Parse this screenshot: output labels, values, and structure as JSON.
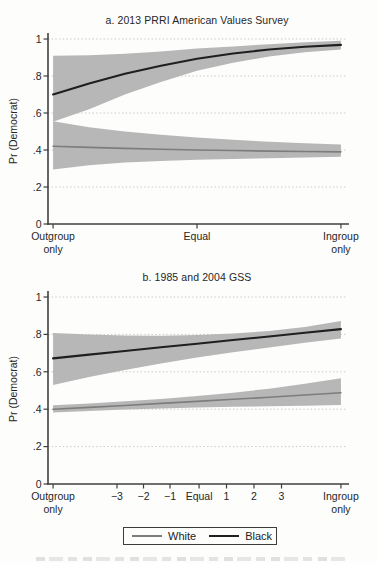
{
  "colors": {
    "band": "#b7b7b7",
    "black_line": "#1f1f1f",
    "white_line": "#7d7d7d",
    "grid": "#c8c8c8",
    "axis": "#3f3f3f",
    "text": "#262626"
  },
  "legend": {
    "items": [
      {
        "label": "White",
        "color_key": "white_line"
      },
      {
        "label": "Black",
        "color_key": "black_line"
      }
    ]
  },
  "chart_data": [
    {
      "type": "line",
      "title": "a. 2013 PRRI American Values Survey",
      "ylabel": "Pr (Democrat)",
      "ylim": [
        0,
        1
      ],
      "grid": "dotted horizontal",
      "x_axis_note": "group identification from Outgroup only to Ingroup only",
      "yticks": [
        {
          "label": "0",
          "v": 0
        },
        {
          "label": ".2",
          "v": 0.2
        },
        {
          "label": ".4",
          "v": 0.4
        },
        {
          "label": ".6",
          "v": 0.6
        },
        {
          "label": ".8",
          "v": 0.8
        },
        {
          "label": "1",
          "v": 1
        }
      ],
      "xticks": [
        {
          "label": [
            "Outgroup",
            "only"
          ],
          "t": 0.017
        },
        {
          "label": "Equal",
          "t": 0.5
        },
        {
          "label": [
            "Ingroup",
            "only"
          ],
          "t": 0.983
        }
      ],
      "t": [
        0.017,
        0.138,
        0.258,
        0.379,
        0.5,
        0.621,
        0.742,
        0.862,
        0.983
      ],
      "series": [
        {
          "name": "Black",
          "color_key": "black_line",
          "width": 2.1,
          "line": [
            0.7,
            0.76,
            0.812,
            0.855,
            0.893,
            0.922,
            0.943,
            0.958,
            0.968
          ],
          "band_upper": [
            0.91,
            0.912,
            0.92,
            0.933,
            0.948,
            0.96,
            0.972,
            0.982,
            0.99
          ],
          "band_lower": [
            0.553,
            0.62,
            0.7,
            0.768,
            0.828,
            0.872,
            0.905,
            0.928,
            0.943
          ]
        },
        {
          "name": "White",
          "color_key": "white_line",
          "width": 1.6,
          "line": [
            0.42,
            0.414,
            0.409,
            0.404,
            0.4,
            0.397,
            0.394,
            0.392,
            0.39
          ],
          "band_upper": [
            0.555,
            0.523,
            0.5,
            0.482,
            0.467,
            0.455,
            0.445,
            0.437,
            0.43
          ],
          "band_lower": [
            0.295,
            0.318,
            0.332,
            0.341,
            0.347,
            0.352,
            0.356,
            0.36,
            0.363
          ]
        }
      ]
    },
    {
      "type": "line",
      "title": "b. 1985 and 2004 GSS",
      "ylabel": "Pr (Democrat)",
      "ylim": [
        0,
        1
      ],
      "grid": "dotted horizontal",
      "x_axis_note": "group identification from Outgroup only (−) to Ingroup only (+)",
      "yticks": [
        {
          "label": "0",
          "v": 0
        },
        {
          "label": ".2",
          "v": 0.2
        },
        {
          "label": ".4",
          "v": 0.4
        },
        {
          "label": ".6",
          "v": 0.6
        },
        {
          "label": ".8",
          "v": 0.8
        },
        {
          "label": "1",
          "v": 1
        }
      ],
      "xticks": [
        {
          "label": [
            "Outgroup",
            "only"
          ],
          "t": 0.017
        },
        {
          "label": "−3",
          "t": 0.2315
        },
        {
          "label": "−2",
          "t": 0.3205
        },
        {
          "label": "−1",
          "t": 0.4094
        },
        {
          "label": "Equal",
          "t": 0.507
        },
        {
          "label": "1",
          "t": 0.599
        },
        {
          "label": "2",
          "t": 0.6913
        },
        {
          "label": "3",
          "t": 0.7836
        },
        {
          "label": [
            "Ingroup",
            "only"
          ],
          "t": 0.983
        }
      ],
      "t": [
        0.017,
        0.138,
        0.258,
        0.379,
        0.5,
        0.621,
        0.742,
        0.862,
        0.983
      ],
      "series": [
        {
          "name": "Black",
          "color_key": "black_line",
          "width": 2.1,
          "line": [
            0.672,
            0.692,
            0.711,
            0.731,
            0.75,
            0.77,
            0.789,
            0.809,
            0.828
          ],
          "band_upper": [
            0.808,
            0.799,
            0.794,
            0.793,
            0.797,
            0.805,
            0.818,
            0.84,
            0.872
          ],
          "band_lower": [
            0.53,
            0.572,
            0.61,
            0.645,
            0.676,
            0.704,
            0.73,
            0.755,
            0.778
          ]
        },
        {
          "name": "White",
          "color_key": "white_line",
          "width": 1.6,
          "line": [
            0.4,
            0.41,
            0.42,
            0.431,
            0.442,
            0.453,
            0.464,
            0.476,
            0.488
          ],
          "band_upper": [
            0.421,
            0.431,
            0.442,
            0.455,
            0.47,
            0.488,
            0.51,
            0.536,
            0.565
          ],
          "band_lower": [
            0.383,
            0.391,
            0.398,
            0.404,
            0.409,
            0.413,
            0.416,
            0.419,
            0.422
          ]
        }
      ]
    }
  ]
}
